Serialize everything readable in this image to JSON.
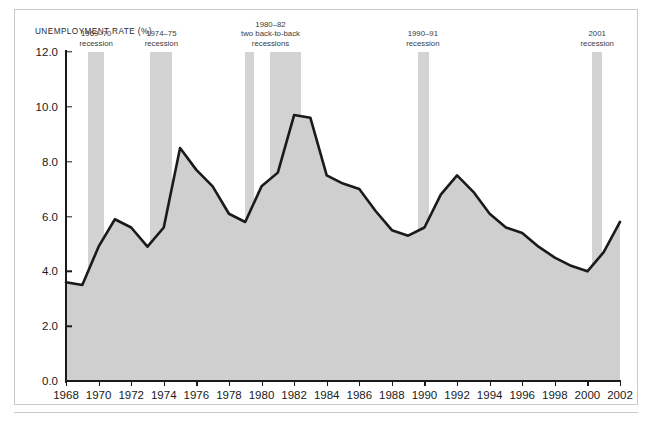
{
  "chart_data": {
    "type": "area",
    "title": "UNEMPLOYMENT RATE (%)",
    "xlabel": "",
    "ylabel": "UNEMPLOYMENT RATE (%)",
    "xlim": [
      1968,
      2002
    ],
    "ylim": [
      0.0,
      12.0
    ],
    "yticks": [
      "0.0",
      "2.0",
      "4.0",
      "6.0",
      "8.0",
      "10.0",
      "12.0"
    ],
    "ytick_values": [
      0.0,
      2.0,
      4.0,
      6.0,
      8.0,
      10.0,
      12.0
    ],
    "xticks": [
      "1968",
      "1970",
      "1972",
      "1974",
      "1976",
      "1978",
      "1980",
      "1982",
      "1984",
      "1986",
      "1988",
      "1990",
      "1992",
      "1994",
      "1996",
      "1998",
      "2000",
      "2002"
    ],
    "xtick_values": [
      1968,
      1970,
      1972,
      1974,
      1976,
      1978,
      1980,
      1982,
      1984,
      1986,
      1988,
      1990,
      1992,
      1994,
      1996,
      1998,
      2000,
      2002
    ],
    "grid": false,
    "legend": "none",
    "x": [
      1968,
      1969,
      1970,
      1971,
      1972,
      1973,
      1974,
      1975,
      1976,
      1977,
      1978,
      1979,
      1980,
      1981,
      1982,
      1983,
      1984,
      1985,
      1986,
      1987,
      1988,
      1989,
      1990,
      1991,
      1992,
      1993,
      1994,
      1995,
      1996,
      1997,
      1998,
      1999,
      2000,
      2001,
      2002
    ],
    "values": [
      3.6,
      3.5,
      4.9,
      5.9,
      5.6,
      4.9,
      5.6,
      8.5,
      7.7,
      7.1,
      6.1,
      5.8,
      7.1,
      7.6,
      9.7,
      9.6,
      7.5,
      7.2,
      7.0,
      6.2,
      5.5,
      5.3,
      5.6,
      6.8,
      7.5,
      6.9,
      6.1,
      5.6,
      5.4,
      4.9,
      4.5,
      4.2,
      4.0,
      4.7,
      5.8
    ],
    "series_name": "Unemployment rate",
    "line_color": "#1a1a1a",
    "fill_color": "#cfcfcf",
    "recession_band_color": "#d3d3d3",
    "recessions": [
      {
        "id": "1969-70",
        "lines": [
          "1969–70",
          "recession"
        ],
        "start": 1969.35,
        "end": 1970.35,
        "label_x": 1969.85
      },
      {
        "id": "1974-75",
        "lines": [
          "1974–75",
          "recession"
        ],
        "start": 1973.15,
        "end": 1974.5,
        "label_x": 1973.85
      },
      {
        "id": "1980-82",
        "lines": [
          "1980–82",
          "two back-to-back",
          "recessions"
        ],
        "start": 1979.0,
        "end": 1979.55,
        "label_x": 1980.55
      },
      {
        "id": "1981-82",
        "lines": [],
        "start": 1980.55,
        "end": 1982.4,
        "label_x": null
      },
      {
        "id": "1990-91",
        "lines": [
          "1990–91",
          "recession"
        ],
        "start": 1989.6,
        "end": 1990.25,
        "label_x": 1989.9
      },
      {
        "id": "2001",
        "lines": [
          "2001",
          "recession"
        ],
        "start": 2000.3,
        "end": 2000.9,
        "label_x": 2000.6
      }
    ]
  }
}
